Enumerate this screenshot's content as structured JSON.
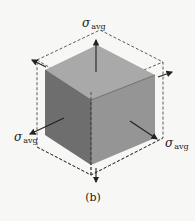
{
  "figure": {
    "caption": "(b)",
    "labels": {
      "top": {
        "symbol": "σ",
        "subscript": "avg"
      },
      "left": {
        "symbol": "σ",
        "subscript": "avg"
      },
      "right": {
        "symbol": "σ",
        "subscript": "avg"
      }
    },
    "colors": {
      "top_face": "#a9a9a9",
      "left_face": "#6e6e6e",
      "right_face": "#959595",
      "dashed_outline": "#333333",
      "arrow": "#222222"
    }
  }
}
